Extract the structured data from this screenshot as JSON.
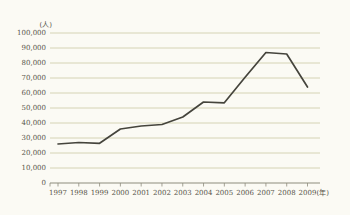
{
  "figure": {
    "kind": "scanned-statistical-line-chart"
  },
  "chart_data": {
    "type": "line",
    "title": "",
    "unit_y_label": "(人)",
    "unit_x_label": "(年)",
    "categories": [
      "1997",
      "1998",
      "1999",
      "2000",
      "2001",
      "2002",
      "2003",
      "2004",
      "2005",
      "2006",
      "2007",
      "2008",
      "2009"
    ],
    "series": [
      {
        "name": "applicants",
        "values": [
          26000,
          27000,
          26500,
          36000,
          38000,
          39000,
          44000,
          54000,
          53500,
          70500,
          87000,
          86000,
          64000
        ]
      }
    ],
    "ylim": [
      0,
      100000
    ],
    "ytick_values": [
      0,
      10000,
      20000,
      30000,
      40000,
      50000,
      60000,
      70000,
      80000,
      90000,
      100000
    ],
    "ytick_labels": [
      "0",
      "10,000",
      "20,000",
      "30,000",
      "40,000",
      "50,000",
      "60,000",
      "70,000",
      "80,000",
      "90,000",
      "100,000"
    ],
    "grid": "horizontal-on",
    "legend": "none",
    "colors": {
      "background": "#fbfaf4",
      "gridline": "#cdc9a5",
      "axis": "#8e8b7c",
      "line": "#45443c",
      "text": "#57544a"
    }
  }
}
